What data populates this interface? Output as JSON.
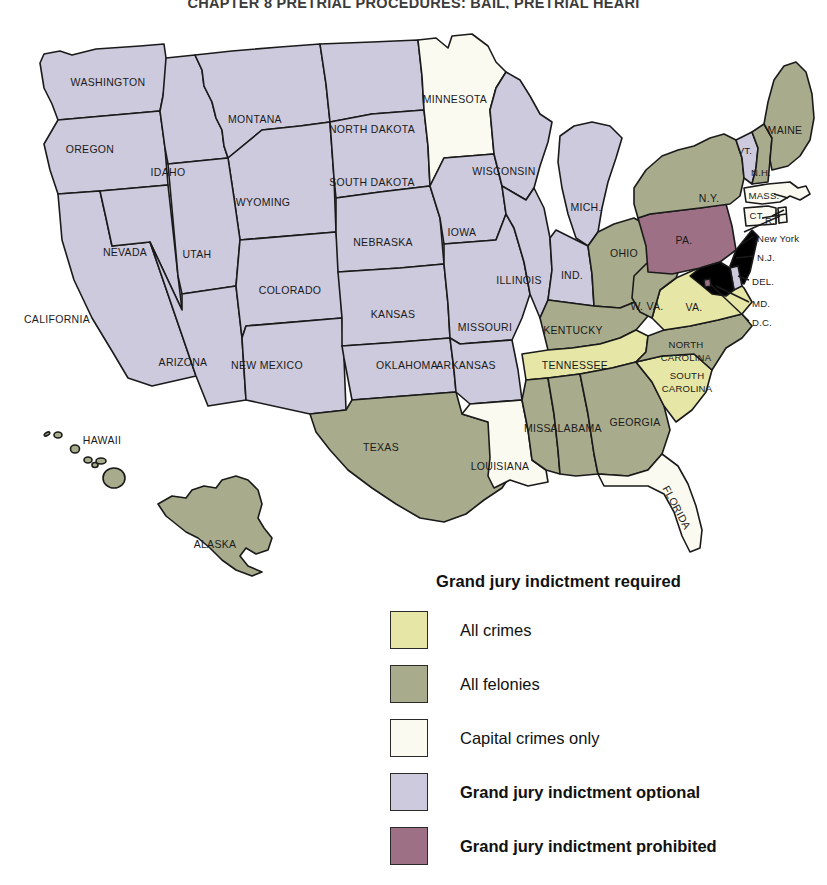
{
  "running_head": "CHAPTER 8  PRETRIAL PROCEDURES: BAIL, PRETRIAL HEARI",
  "legend": {
    "title": "Grand jury indictment required",
    "items": [
      {
        "label": "All crimes",
        "color": "#e6e6a6",
        "bold": false,
        "key": "all-crimes"
      },
      {
        "label": "All felonies",
        "color": "#a8ac8d",
        "bold": false,
        "key": "all-felonies"
      },
      {
        "label": "Capital crimes only",
        "color": "#fafaf0",
        "bold": false,
        "key": "capital-crimes-only"
      },
      {
        "label": "Grand jury indictment optional",
        "color": "#cdcade",
        "bold": true,
        "key": "optional"
      },
      {
        "label": "Grand jury indictment prohibited",
        "color": "#9d7085",
        "bold": true,
        "key": "prohibited"
      }
    ]
  },
  "colors": {
    "all_crimes": "#e6e6a6",
    "all_felonies": "#a8ac8d",
    "capital_only": "#fafaf0",
    "optional": "#cdcade",
    "prohibited": "#9d7085",
    "outline": "#1a1a1a"
  },
  "map": {
    "title": "Grand jury indictment requirements by state",
    "states": [
      {
        "code": "WA",
        "label": "WASHINGTON",
        "category": "optional",
        "lx": 108,
        "ly": 65,
        "size": "md"
      },
      {
        "code": "OR",
        "label": "OREGON",
        "category": "optional",
        "lx": 90,
        "ly": 132,
        "size": "md"
      },
      {
        "code": "CA",
        "label": "CALIFORNIA",
        "category": "optional",
        "lx": 57,
        "ly": 302,
        "size": "md"
      },
      {
        "code": "NV",
        "label": "NEVADA",
        "category": "optional",
        "lx": 125,
        "ly": 235,
        "size": "md"
      },
      {
        "code": "ID",
        "label": "IDAHO",
        "category": "optional",
        "lx": 168,
        "ly": 155,
        "size": "md"
      },
      {
        "code": "MT",
        "label": "MONTANA",
        "category": "optional",
        "lx": 255,
        "ly": 102,
        "size": "md"
      },
      {
        "code": "WY",
        "label": "WYOMING",
        "category": "optional",
        "lx": 263,
        "ly": 185,
        "size": "md"
      },
      {
        "code": "UT",
        "label": "UTAH",
        "category": "optional",
        "lx": 197,
        "ly": 237,
        "size": "md"
      },
      {
        "code": "AZ",
        "label": "ARIZONA",
        "category": "optional",
        "lx": 183,
        "ly": 345,
        "size": "md"
      },
      {
        "code": "CO",
        "label": "COLORADO",
        "category": "optional",
        "lx": 290,
        "ly": 273,
        "size": "md"
      },
      {
        "code": "NM",
        "label": "NEW MEXICO",
        "category": "optional",
        "lx": 267,
        "ly": 348,
        "size": "md"
      },
      {
        "code": "ND",
        "label": "NORTH DAKOTA",
        "category": "optional",
        "lx": 372,
        "ly": 112,
        "size": "md"
      },
      {
        "code": "SD",
        "label": "SOUTH DAKOTA",
        "category": "optional",
        "lx": 372,
        "ly": 165,
        "size": "md"
      },
      {
        "code": "NE",
        "label": "NEBRASKA",
        "category": "optional",
        "lx": 383,
        "ly": 225,
        "size": "md"
      },
      {
        "code": "KS",
        "label": "KANSAS",
        "category": "optional",
        "lx": 393,
        "ly": 297,
        "size": "md"
      },
      {
        "code": "OK",
        "label": "OKLAHOMA",
        "category": "optional",
        "lx": 407,
        "ly": 348,
        "size": "md"
      },
      {
        "code": "TX",
        "label": "TEXAS",
        "category": "all_felonies",
        "lx": 381,
        "ly": 430,
        "size": "md"
      },
      {
        "code": "MN",
        "label": "MINNESOTA",
        "category": "capital_only",
        "lx": 455,
        "ly": 82,
        "size": "md"
      },
      {
        "code": "IA",
        "label": "IOWA",
        "category": "optional",
        "lx": 462,
        "ly": 215,
        "size": "md"
      },
      {
        "code": "MO",
        "label": "MISSOURI",
        "category": "optional",
        "lx": 485,
        "ly": 310,
        "size": "md"
      },
      {
        "code": "AR",
        "label": "ARKANSAS",
        "category": "optional",
        "lx": 466,
        "ly": 348,
        "size": "md"
      },
      {
        "code": "LA",
        "label": "LOUISIANA",
        "category": "capital_only",
        "lx": 500,
        "ly": 449,
        "size": "md"
      },
      {
        "code": "WI",
        "label": "WISCONSIN",
        "category": "optional",
        "lx": 504,
        "ly": 154,
        "size": "md"
      },
      {
        "code": "IL",
        "label": "ILLINOIS",
        "category": "optional",
        "lx": 519,
        "ly": 263,
        "size": "md"
      },
      {
        "code": "MI",
        "label": "MICH.",
        "category": "optional",
        "lx": 586,
        "ly": 190,
        "size": "md"
      },
      {
        "code": "IN",
        "label": "IND.",
        "category": "optional",
        "lx": 572,
        "ly": 258,
        "size": "md"
      },
      {
        "code": "OH",
        "label": "OHIO",
        "category": "all_felonies",
        "lx": 624,
        "ly": 236,
        "size": "md"
      },
      {
        "code": "KY",
        "label": "KENTUCKY",
        "category": "all_felonies",
        "lx": 573,
        "ly": 313,
        "size": "md"
      },
      {
        "code": "TN",
        "label": "TENNESSEE",
        "category": "all_crimes",
        "lx": 575,
        "ly": 348,
        "size": "md"
      },
      {
        "code": "MS",
        "label": "MISS.",
        "category": "all_felonies",
        "lx": 539,
        "ly": 411,
        "size": "md"
      },
      {
        "code": "AL",
        "label": "ALABAMA",
        "category": "all_felonies",
        "lx": 576,
        "ly": 411,
        "size": "md"
      },
      {
        "code": "GA",
        "label": "GEORGIA",
        "category": "all_felonies",
        "lx": 635,
        "ly": 405,
        "size": "md"
      },
      {
        "code": "FL",
        "label": "FLORIDA",
        "category": "capital_only",
        "lx": 676,
        "ly": 490,
        "size": "md"
      },
      {
        "code": "SC",
        "label": "SOUTH CAROLINA",
        "category": "all_crimes",
        "lx": 687,
        "ly": 364,
        "size": "sm"
      },
      {
        "code": "NC",
        "label": "NORTH CAROLINA",
        "category": "all_felonies",
        "lx": 686,
        "ly": 333,
        "size": "sm"
      },
      {
        "code": "VA",
        "label": "VA.",
        "category": "all_crimes",
        "lx": 694,
        "ly": 290,
        "size": "md"
      },
      {
        "code": "WV",
        "label": "W. VA.",
        "category": "all_felonies",
        "lx": 647,
        "ly": 289,
        "size": "md"
      },
      {
        "code": "PA",
        "label": "PA.",
        "category": "prohibited",
        "lx": 684,
        "ly": 223,
        "size": "md"
      },
      {
        "code": "NY",
        "label": "N.Y.",
        "category": "all_felonies",
        "lx": 709,
        "ly": 181,
        "size": "md"
      },
      {
        "code": "VT",
        "label": "VT.",
        "category": "optional",
        "lx": 745,
        "ly": 133,
        "size": "sm"
      },
      {
        "code": "NH",
        "label": "N.H.",
        "category": "all_felonies",
        "lx": 761,
        "ly": 155,
        "size": "sm"
      },
      {
        "code": "ME",
        "label": "MAINE",
        "category": "all_felonies",
        "lx": 785,
        "ly": 113,
        "size": "md"
      },
      {
        "code": "MA",
        "label": "MASS.",
        "category": "capital_only",
        "lx": 764,
        "ly": 178,
        "size": "sm"
      },
      {
        "code": "CT",
        "label": "CT.",
        "category": "capital_only",
        "lx": 757,
        "ly": 198,
        "size": "sm"
      },
      {
        "code": "AK",
        "label": "ALASKA",
        "category": "all_felonies",
        "lx": 215,
        "ly": 527,
        "size": "md"
      },
      {
        "code": "HI",
        "label": "HAWAII",
        "category": "all_felonies",
        "lx": 102,
        "ly": 423,
        "size": "md"
      }
    ],
    "callouts": [
      {
        "label": "R.I.",
        "x": 765,
        "y": 203
      },
      {
        "label": "New York",
        "x": 757,
        "y": 221
      },
      {
        "label": "N.J.",
        "x": 757,
        "y": 240
      },
      {
        "label": "DEL.",
        "x": 752,
        "y": 264
      },
      {
        "label": "MD.",
        "x": 752,
        "y": 286
      },
      {
        "label": "D.C.",
        "x": 752,
        "y": 305
      }
    ]
  }
}
